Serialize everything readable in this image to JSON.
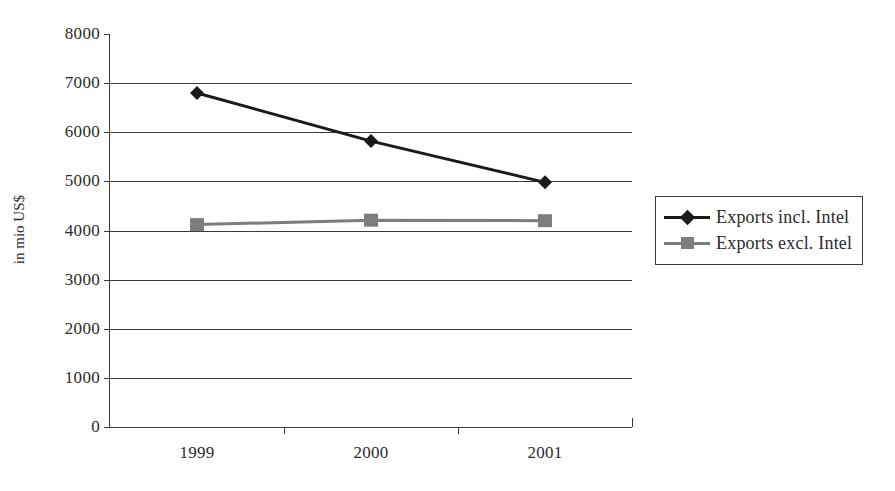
{
  "chart_data": {
    "type": "line",
    "title": "",
    "xlabel": "",
    "ylabel": "in mio US$",
    "categories": [
      "1999",
      "2000",
      "2001"
    ],
    "ylim": [
      0,
      8000
    ],
    "ytick_labels": [
      "0",
      "1000",
      "2000",
      "3000",
      "4000",
      "5000",
      "6000",
      "7000",
      "8000"
    ],
    "ytick_values": [
      0,
      1000,
      2000,
      3000,
      4000,
      5000,
      6000,
      7000,
      8000
    ],
    "ytick_step": 1000,
    "grid": "horizontal gridlines at 0-7000",
    "legend_position": "right",
    "series": [
      {
        "name": "Exports incl. Intel",
        "values": [
          6800,
          5820,
          4980
        ],
        "color": "#1a1a1a",
        "marker": "diamond"
      },
      {
        "name": "Exports excl. Intel",
        "values": [
          4120,
          4210,
          4200
        ],
        "color": "#7d7d7d",
        "marker": "square"
      }
    ]
  },
  "legend": {
    "items": [
      {
        "label": "Exports incl. Intel",
        "marker": "diamond-marker",
        "color": "#1a1a1a"
      },
      {
        "label": "Exports excl. Intel",
        "marker": "square-marker",
        "color": "#7d7d7d"
      }
    ]
  },
  "colors": {
    "axis": "#3a3a3a",
    "text": "#2b2b2b",
    "series_incl": "#1a1a1a",
    "series_excl": "#7d7d7d",
    "background": "#ffffff"
  }
}
